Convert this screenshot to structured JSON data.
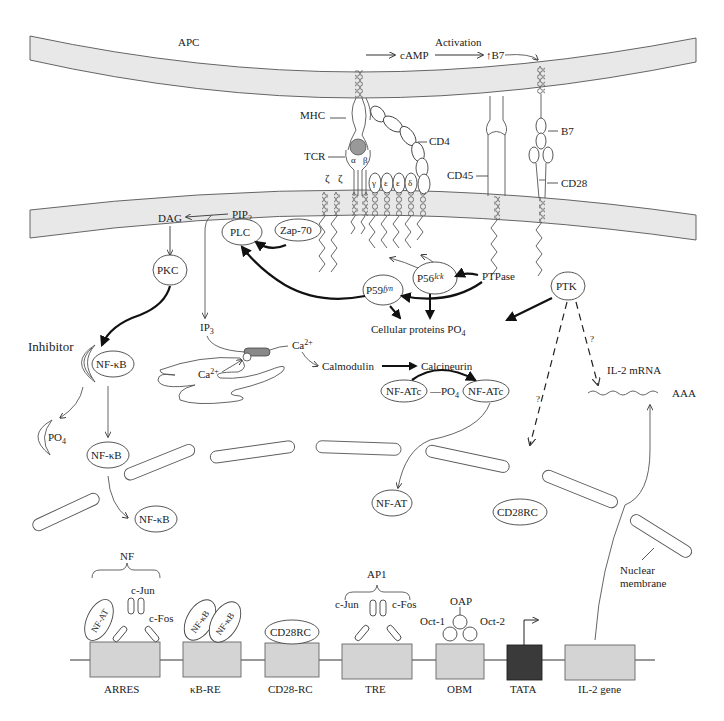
{
  "diagram": {
    "membranes": {
      "apc": "APC",
      "nuclear": "Nuclear membrane"
    },
    "top_flow": {
      "camp": "cAMP",
      "activation": "Activation",
      "b7_up": "↑B7"
    },
    "receptors": {
      "mhc": "MHC",
      "cd4": "CD4",
      "tcr": "TCR",
      "alpha": "α",
      "beta": "β",
      "zeta1": "ζ",
      "zeta2": "ζ",
      "gamma": "γ",
      "epsilon1": "ε",
      "epsilon2": "ε",
      "delta": "δ",
      "cd45": "CD45",
      "b7": "B7",
      "cd28": "CD28"
    },
    "signaling": {
      "dag": "DAG",
      "pip2": "PIP",
      "pip2_sub": "2",
      "plc": "PLC",
      "zap70": "Zap-70",
      "pkc": "PKC",
      "p59": "P59",
      "p59_sup": "fyn",
      "p56": "P56",
      "p56_sup": "lck",
      "ptpase": "PTPase",
      "ptk": "PTK",
      "ip3": "IP",
      "ip3_sub": "3",
      "cellular_proteins": "Cellular proteins PO",
      "cellular_proteins_sub": "4",
      "inhibitor": "Inhibitor",
      "nfkb": "NF-κB",
      "po4": "PO",
      "po4_sub": "4",
      "ca": "Ca",
      "ca_sup": "2+",
      "calmodulin": "Calmodulin",
      "calcineurin": "Calcineurin",
      "nfatc": "NF-ATc",
      "nfat": "NF-AT",
      "il2_mrna": "IL-2 mRNA",
      "aaa": "AAA",
      "question": "?",
      "cd28rc": "CD28RC"
    },
    "promoter": {
      "nf_bracket": "NF",
      "ap1_bracket": "AP1",
      "cjun": "c-Jun",
      "cfos": "c-Fos",
      "nfat": "NF-AT",
      "nfkb": "NF-κB",
      "cd28rc": "CD28RC",
      "oct1": "Oct-1",
      "oct2": "Oct-2",
      "oap": "OAP",
      "elements": [
        {
          "label": "ARRES",
          "color": "#d4d4d4"
        },
        {
          "label": "κB-RE",
          "color": "#d4d4d4"
        },
        {
          "label": "CD28-RC",
          "color": "#d4d4d4"
        },
        {
          "label": "TRE",
          "color": "#d4d4d4"
        },
        {
          "label": "OBM",
          "color": "#d4d4d4"
        },
        {
          "label": "TATA",
          "color": "#3a3a3a"
        },
        {
          "label": "IL-2 gene",
          "color": "#d4d4d4"
        }
      ]
    }
  }
}
